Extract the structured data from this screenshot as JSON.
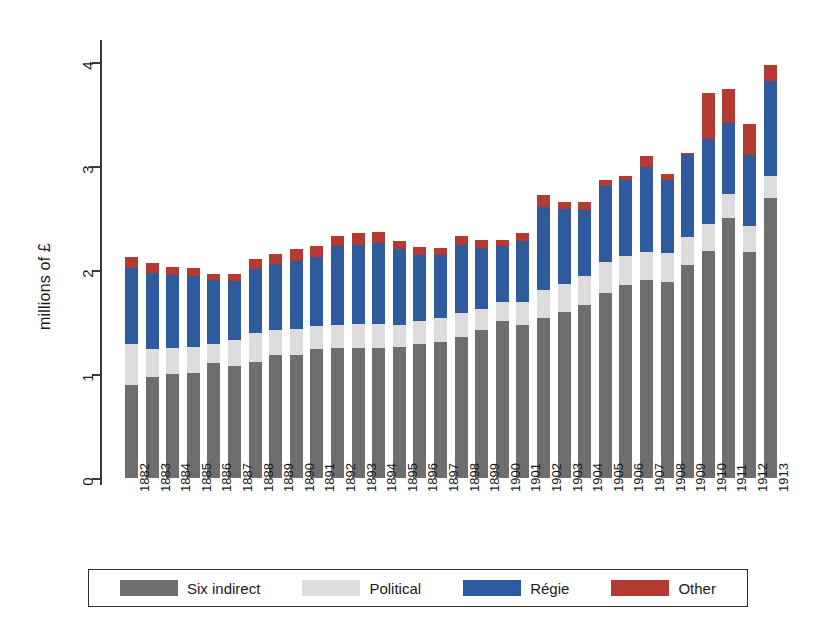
{
  "chart_data": {
    "type": "bar",
    "stacked": true,
    "title": "",
    "xlabel": "",
    "ylabel": "millions of £",
    "ylim": [
      0,
      4
    ],
    "yticks": [
      0,
      1,
      2,
      3,
      4
    ],
    "ytick_labels": [
      "0",
      "1",
      "2",
      "3",
      "4"
    ],
    "grid": false,
    "legend_position": "bottom",
    "categories": [
      "1882",
      "1883",
      "1884",
      "1885",
      "1886",
      "1887",
      "1888",
      "1889",
      "1890",
      "1891",
      "1892",
      "1893",
      "1894",
      "1895",
      "1896",
      "1897",
      "1898",
      "1899",
      "1900",
      "1901",
      "1902",
      "1903",
      "1904",
      "1905",
      "1906",
      "1907",
      "1908",
      "1909",
      "1910",
      "1911",
      "1912",
      "1913"
    ],
    "series": [
      {
        "name": "Six indirect",
        "color": "#6e6e6e",
        "values": [
          0.89,
          0.97,
          1.0,
          1.01,
          1.11,
          1.08,
          1.12,
          1.18,
          1.18,
          1.24,
          1.25,
          1.25,
          1.25,
          1.26,
          1.29,
          1.31,
          1.36,
          1.42,
          1.51,
          1.47,
          1.54,
          1.6,
          1.66,
          1.78,
          1.86,
          1.9,
          1.88,
          2.05,
          2.18,
          2.5,
          2.17,
          2.69
        ]
      },
      {
        "name": "Political",
        "color": "#dcdcdc",
        "values": [
          0.4,
          0.27,
          0.25,
          0.25,
          0.18,
          0.25,
          0.27,
          0.24,
          0.25,
          0.22,
          0.22,
          0.23,
          0.23,
          0.21,
          0.22,
          0.23,
          0.23,
          0.21,
          0.18,
          0.22,
          0.27,
          0.27,
          0.28,
          0.3,
          0.27,
          0.27,
          0.28,
          0.27,
          0.26,
          0.23,
          0.25,
          0.21
        ]
      },
      {
        "name": "Régie",
        "color": "#2e5b9e",
        "values": [
          0.73,
          0.73,
          0.7,
          0.68,
          0.61,
          0.56,
          0.62,
          0.64,
          0.66,
          0.67,
          0.76,
          0.76,
          0.78,
          0.73,
          0.63,
          0.6,
          0.65,
          0.58,
          0.54,
          0.59,
          0.8,
          0.72,
          0.64,
          0.73,
          0.74,
          0.82,
          0.71,
          0.79,
          0.82,
          0.68,
          0.69,
          0.92
        ]
      },
      {
        "name": "Other",
        "color": "#b33b32",
        "values": [
          0.11,
          0.1,
          0.08,
          0.08,
          0.06,
          0.07,
          0.1,
          0.09,
          0.11,
          0.1,
          0.1,
          0.12,
          0.11,
          0.08,
          0.08,
          0.07,
          0.09,
          0.08,
          0.06,
          0.08,
          0.11,
          0.06,
          0.07,
          0.06,
          0.03,
          0.11,
          0.05,
          0.02,
          0.44,
          0.33,
          0.29,
          0.15
        ]
      }
    ]
  },
  "legend": {
    "items": [
      {
        "label": "Six indirect",
        "color": "#6e6e6e"
      },
      {
        "label": "Political",
        "color": "#dcdcdc"
      },
      {
        "label": "Régie",
        "color": "#2e5b9e"
      },
      {
        "label": "Other",
        "color": "#b33b32"
      }
    ]
  },
  "axis": {
    "y_title": "millions of £"
  }
}
